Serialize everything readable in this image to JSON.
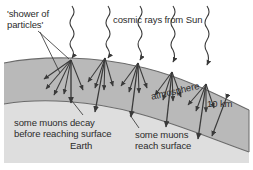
{
  "figure": {
    "labels": {
      "shower_of_particles": "'shower of\nparticles'",
      "cosmic_rays": "cosmic rays from Sun",
      "atmosphere": "atmosphere",
      "thickness": "10 km",
      "muons_decay": "some muons decay\nbefore reaching surface",
      "earth": "Earth",
      "muons_reach": "some muons\nreach surface"
    },
    "colors": {
      "background": "#ffffff",
      "atmosphere_fill": "#b9b9b9",
      "earth_fill": "#dedede",
      "outline": "#5a5a5a",
      "ray_stroke": "#3a3a3a",
      "text": "#2b2b2b"
    },
    "elements": {
      "cosmic_ray_count": 5,
      "shower_vertex_count": 5,
      "atmosphere_thickness_label": "10 km"
    }
  }
}
